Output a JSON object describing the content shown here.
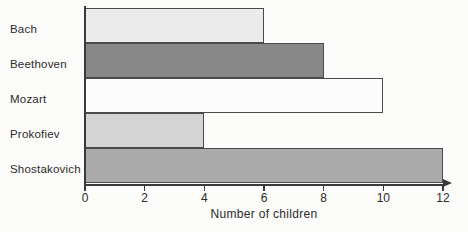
{
  "chart_data": {
    "type": "bar",
    "orientation": "horizontal",
    "title": "",
    "xlabel": "Number of children",
    "ylabel": "",
    "categories": [
      "Bach",
      "Beethoven",
      "Mozart",
      "Prokofiev",
      "Shostakovich"
    ],
    "values": [
      6,
      8,
      10,
      4,
      12
    ],
    "xlim": [
      0,
      12
    ],
    "xticks": [
      0,
      2,
      4,
      6,
      8,
      10,
      12
    ],
    "xtick_labels": [
      "0",
      "2",
      "4",
      "6",
      "8",
      "10",
      "12"
    ],
    "grid": false,
    "legend": null,
    "bar_colors": [
      "#ebebeb",
      "#888888",
      "#fcfcfc",
      "#d4d4d4",
      "#ababab"
    ],
    "bar_edge_color": "#4a4a4a",
    "axis_color": "#3a3a3a",
    "background_color": "#fbfbf9",
    "bars": [
      {
        "category": "Bach",
        "value": 6,
        "color": "#ebebeb"
      },
      {
        "category": "Beethoven",
        "value": 8,
        "color": "#888888"
      },
      {
        "category": "Mozart",
        "value": 10,
        "color": "#fcfcfc"
      },
      {
        "category": "Prokofiev",
        "value": 4,
        "color": "#d4d4d4"
      },
      {
        "category": "Shostakovich",
        "value": 12,
        "color": "#ababab"
      }
    ]
  }
}
